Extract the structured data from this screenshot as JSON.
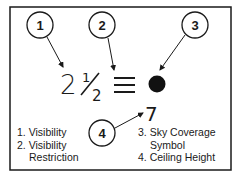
{
  "diagram": {
    "callouts": [
      {
        "number": "1"
      },
      {
        "number": "2"
      },
      {
        "number": "3"
      },
      {
        "number": "4"
      }
    ],
    "station_model": {
      "visibility_whole": "2",
      "visibility_fraction": "1/2",
      "visibility_fraction_num": "1",
      "visibility_fraction_den": "2",
      "visibility_restriction_symbol": "≡",
      "sky_coverage_symbol": "filled-circle",
      "ceiling_height": "7"
    },
    "legend_left": [
      {
        "num": "1.",
        "label": "Visibility"
      },
      {
        "num": "2.",
        "label": "Visibility"
      },
      {
        "num": "",
        "label": "Restriction"
      }
    ],
    "legend_right": [
      {
        "num": "3.",
        "label": "Sky Coverage"
      },
      {
        "num": "",
        "label": "Symbol"
      },
      {
        "num": "4.",
        "label": "Ceiling Height"
      }
    ],
    "colors": {
      "ink": "#1a1a1a",
      "background": "#ffffff"
    }
  }
}
